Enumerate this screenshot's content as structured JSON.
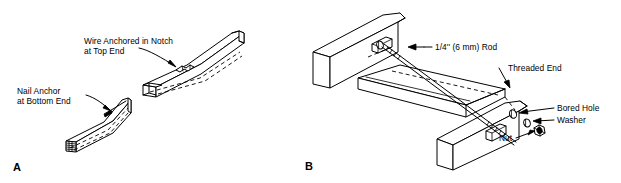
{
  "figure": {
    "background_color": "#ffffff",
    "line_color": "#000000",
    "width": 621,
    "height": 183,
    "style": "technical line drawing"
  },
  "panels": [
    {
      "id": "panel-a",
      "letter": "A",
      "subject": "Wire anchored between two wood members",
      "labels": [
        {
          "id": "wire-anchored-notch",
          "line1": "Wire Anchored in Notch",
          "line2": "at Top End"
        },
        {
          "id": "nail-anchor-bottom",
          "line1": "Nail Anchor",
          "line2": "at Bottom End"
        }
      ]
    },
    {
      "id": "panel-b",
      "letter": "B",
      "subject": "Threaded rod assembly joining two wood members",
      "labels": [
        {
          "id": "rod",
          "text": "1/4'' (6 mm) Rod"
        },
        {
          "id": "threaded-end",
          "text": "Threaded End"
        },
        {
          "id": "bored-hole",
          "text": "Bored Hole"
        },
        {
          "id": "washer",
          "text": "Washer"
        },
        {
          "id": "nut",
          "text": "Nut"
        }
      ]
    }
  ]
}
